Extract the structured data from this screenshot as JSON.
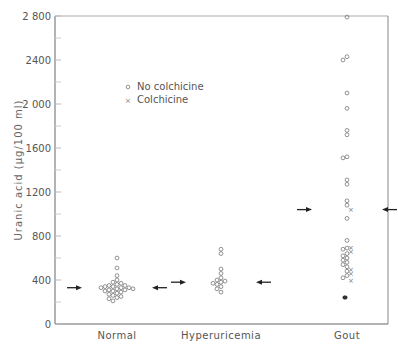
{
  "chart_data": {
    "type": "scatter",
    "title": "",
    "xlabel": "",
    "ylabel": "Uranic acid (μg/100 ml)",
    "ylim": [
      0,
      2800
    ],
    "yticks": [
      0,
      400,
      800,
      1200,
      1600,
      2000,
      2400,
      2800
    ],
    "ytick_labels": [
      "0",
      "400",
      "800",
      "1200",
      "1600",
      "2 000",
      "2400",
      "2 800"
    ],
    "minor_yticks": [
      200,
      600,
      1000,
      1400,
      1800,
      2200,
      2600
    ],
    "categories": [
      "Normal",
      "Hyperuricemia",
      "Gout"
    ],
    "grid": false,
    "legend": {
      "position": "upper-left inside",
      "entries": [
        {
          "marker": "circle-open",
          "label": "No colchicine"
        },
        {
          "marker": "cross",
          "label": "Colchicine"
        }
      ]
    },
    "mean_arrows": [
      {
        "category": "Normal",
        "value": 330
      },
      {
        "category": "Hyperuricemia",
        "value": 380
      },
      {
        "category": "Gout",
        "value": 1040
      }
    ],
    "series": [
      {
        "name": "No colchicine",
        "marker": "circle-open",
        "points": {
          "Normal": [
            600,
            510,
            440,
            400,
            380,
            370,
            360,
            350,
            350,
            340,
            340,
            330,
            330,
            330,
            320,
            320,
            310,
            310,
            300,
            300,
            290,
            280,
            270,
            260,
            250,
            240,
            230,
            210
          ],
          "Hyperuricemia": [
            680,
            640,
            500,
            460,
            420,
            400,
            390,
            380,
            370,
            360,
            340,
            320,
            290
          ],
          "Gout": [
            2790,
            2430,
            2400,
            2100,
            1960,
            1760,
            1720,
            1520,
            1510,
            1310,
            1270,
            1120,
            1080,
            960,
            760,
            690,
            680,
            640,
            620,
            600,
            580,
            560,
            540,
            520,
            480,
            440,
            420
          ]
        }
      },
      {
        "name": "Colchicine",
        "marker": "cross",
        "points": {
          "Gout": [
            1040,
            700,
            660,
            500,
            460,
            400
          ]
        }
      },
      {
        "name": "Filled",
        "marker": "circle-filled",
        "points": {
          "Gout": [
            350,
            350
          ]
        }
      }
    ]
  }
}
